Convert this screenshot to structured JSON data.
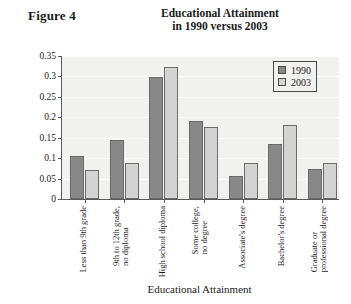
{
  "figure_label": "Figure 4",
  "title_line1": "Educational Attainment",
  "title_line2": "in 1990 versus 2003",
  "legend": {
    "position": "top-right",
    "entries": [
      {
        "label": "1990",
        "color": "#888888"
      },
      {
        "label": "2003",
        "color": "#d3d3d3"
      }
    ]
  },
  "chart_data": {
    "type": "bar",
    "title": "Educational Attainment in 1990 versus 2003",
    "xlabel": "Educational Attainment",
    "ylabel": "Relative Frequency",
    "ylim": [
      0,
      0.35
    ],
    "yticks": [
      0,
      0.05,
      0.1,
      0.15,
      0.2,
      0.25,
      0.3,
      0.35
    ],
    "ytick_labels": [
      "0",
      "0.05",
      "0.1",
      "0.15",
      "0.2",
      "0.25",
      "0.3",
      "0.35"
    ],
    "grid": true,
    "legend_position": "top right",
    "categories": [
      "Less than 9th grade",
      "9th to 12th grade, no diploma",
      "High school diploma",
      "Some college, no degree",
      "Associate's degree",
      "Bachelor's degree",
      "Graduate or professional degree"
    ],
    "category_lines": [
      [
        "Less than 9th grade",
        ""
      ],
      [
        "9th to 12th grade,",
        "no diploma"
      ],
      [
        "High school diploma",
        ""
      ],
      [
        "Some college,",
        "no degree"
      ],
      [
        "Associate's degree",
        ""
      ],
      [
        "Bachelor's degree",
        ""
      ],
      [
        "Graduate or",
        "professional degree"
      ]
    ],
    "series": [
      {
        "name": "1990",
        "color": "#888888",
        "values": [
          0.105,
          0.145,
          0.298,
          0.19,
          0.057,
          0.135,
          0.074
        ]
      },
      {
        "name": "2003",
        "color": "#d3d3d3",
        "values": [
          0.071,
          0.087,
          0.322,
          0.177,
          0.087,
          0.18,
          0.089
        ]
      }
    ]
  }
}
